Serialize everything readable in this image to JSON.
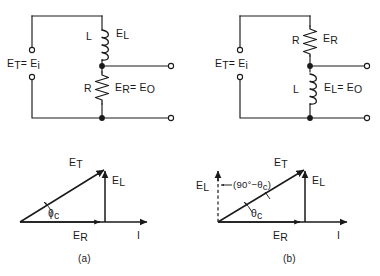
{
  "figure": {
    "ink_color": "#1a1a1a",
    "background_color": "#ffffff",
    "panels": [
      {
        "id": "a",
        "caption": "(a)",
        "circuit": {
          "name": "low-pass-RL-output-across-resistor",
          "input_label_main": "E",
          "input_label_sub1": "T",
          "input_label_eq": "= E",
          "input_label_sub2": "i",
          "input_label_full": "E_T = E_i",
          "series_component": {
            "symbol": "L",
            "type": "inductor",
            "voltage_main": "E",
            "voltage_sub": "L",
            "voltage_full": "E_L"
          },
          "shunt_component": {
            "symbol": "R",
            "type": "resistor",
            "voltage_main": "E",
            "voltage_sub": "R",
            "voltage_eq": "= E",
            "voltage_sub2": "O",
            "voltage_full": "E_R = E_O"
          }
        },
        "phasor": {
          "name": "phasor-diagram-a",
          "vectors": [
            {
              "label_main": "E",
              "label_sub": "T",
              "label_full": "E_T",
              "kind": "resultant",
              "direction": "diagonal-up-right"
            },
            {
              "label_main": "E",
              "label_sub": "L",
              "label_full": "E_L",
              "kind": "reactive",
              "direction": "vertical-up"
            },
            {
              "label_main": "E",
              "label_sub": "R",
              "label_full": "E_R",
              "kind": "resistive",
              "direction": "horizontal-right"
            },
            {
              "label_main": "I",
              "label_sub": "",
              "label_full": "I",
              "kind": "current-reference",
              "direction": "horizontal-right"
            }
          ],
          "angle_main": "θ",
          "angle_sub": "c",
          "angle_full": "θ_c",
          "angle_degrees": 38
        }
      },
      {
        "id": "b",
        "caption": "(b)",
        "circuit": {
          "name": "high-pass-RL-output-across-inductor",
          "input_label_main": "E",
          "input_label_sub1": "T",
          "input_label_eq": "= E",
          "input_label_sub2": "i",
          "input_label_full": "E_T = E_i",
          "series_component": {
            "symbol": "R",
            "type": "resistor",
            "voltage_main": "E",
            "voltage_sub": "R",
            "voltage_full": "E_R"
          },
          "shunt_component": {
            "symbol": "L",
            "type": "inductor",
            "voltage_main": "E",
            "voltage_sub": "L",
            "voltage_eq": "= E",
            "voltage_sub2": "O",
            "voltage_full": "E_L = E_O"
          }
        },
        "phasor": {
          "name": "phasor-diagram-b",
          "vectors": [
            {
              "label_main": "E",
              "label_sub": "T",
              "label_full": "E_T",
              "kind": "resultant",
              "direction": "diagonal-up-right"
            },
            {
              "label_main": "E",
              "label_sub": "L",
              "label_full": "E_L",
              "kind": "reactive",
              "direction": "vertical-up"
            },
            {
              "label_main": "E",
              "label_sub": "R",
              "label_full": "E_R",
              "kind": "resistive",
              "direction": "horizontal-right"
            },
            {
              "label_main": "I",
              "label_sub": "",
              "label_full": "I",
              "kind": "current-reference",
              "direction": "horizontal-right"
            }
          ],
          "reference_vector": {
            "label_main": "E",
            "label_sub": "L",
            "label_full": "E_L",
            "style": "dashed-vertical-left"
          },
          "angle_main": "θ",
          "angle_sub": "c",
          "angle_full": "θ_c",
          "angle_degrees": 38,
          "complement_annotation_open": "(90°−",
          "complement_annotation_main": "θ",
          "complement_annotation_sub": "c",
          "complement_annotation_close": ")",
          "complement_annotation_full": "(90°−θ_c)"
        }
      }
    ]
  }
}
